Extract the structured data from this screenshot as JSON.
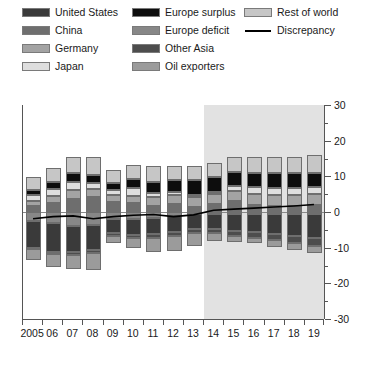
{
  "legend": {
    "columns": [
      [
        {
          "label": "United States",
          "key": "us",
          "color": "#3a3a3a",
          "type": "swatch",
          "icon": "legend-swatch"
        },
        {
          "label": "China",
          "key": "china",
          "color": "#6e6e6e",
          "type": "swatch",
          "icon": "legend-swatch"
        },
        {
          "label": "Germany",
          "key": "germany",
          "color": "#a3a3a3",
          "type": "swatch",
          "icon": "legend-swatch"
        },
        {
          "label": "Japan",
          "key": "japan",
          "color": "#dedede",
          "type": "swatch",
          "icon": "legend-swatch"
        }
      ],
      [
        {
          "label": "Europe surplus",
          "key": "europe_surplus",
          "color": "#0d0d0d",
          "type": "swatch",
          "icon": "legend-swatch"
        },
        {
          "label": "Europe deficit",
          "key": "europe_deficit",
          "color": "#878787",
          "type": "swatch",
          "icon": "legend-swatch"
        },
        {
          "label": "Other Asia",
          "key": "other_asia",
          "color": "#4d4d4d",
          "type": "swatch",
          "icon": "legend-swatch"
        },
        {
          "label": "Oil exporters",
          "key": "oil_exporters",
          "color": "#9b9b9b",
          "type": "swatch",
          "icon": "legend-swatch"
        }
      ],
      [
        {
          "label": "Rest of world",
          "key": "rest_of_world",
          "color": "#c6c6c6",
          "type": "swatch",
          "icon": "legend-swatch"
        },
        {
          "label": "Discrepancy",
          "key": "discrepancy",
          "color": "#000000",
          "type": "line",
          "icon": "legend-line"
        }
      ]
    ]
  },
  "chart_data": {
    "type": "bar",
    "stacked": true,
    "title": "",
    "subtitle": "",
    "xlabel": "",
    "ylabel": "",
    "ylim": [
      -30,
      30
    ],
    "yticks": [
      30,
      20,
      10,
      0,
      -10,
      -20,
      -30
    ],
    "yticks_minor": [
      25,
      15,
      5,
      -5,
      -15,
      -25
    ],
    "grid": false,
    "legend_position": "top",
    "axis_side": "right",
    "categories": [
      "2005",
      "06",
      "07",
      "08",
      "09",
      "10",
      "11",
      "12",
      "13",
      "14",
      "15",
      "16",
      "17",
      "18",
      "19"
    ],
    "forecast_start_category": "14",
    "forecast_shading": {
      "from": "13.5",
      "to": "19.5",
      "color": "#e2e2e2",
      "label": "projection"
    },
    "series": [
      {
        "name": "Rest of world",
        "key": "rest_of_world",
        "color": "#c6c6c6",
        "sign": "positive",
        "values": [
          3.5,
          4.0,
          4.5,
          5.0,
          3.5,
          4.0,
          4.5,
          4.0,
          4.0,
          4.0,
          4.0,
          4.5,
          4.5,
          4.5,
          5.0
        ]
      },
      {
        "name": "Europe surplus",
        "key": "europe_surplus",
        "color": "#0d0d0d",
        "sign": "positive",
        "values": [
          1.5,
          2.0,
          2.5,
          2.5,
          2.0,
          2.5,
          3.0,
          3.5,
          4.0,
          4.0,
          4.0,
          4.0,
          4.0,
          4.0,
          4.0
        ]
      },
      {
        "name": "Japan",
        "key": "japan",
        "color": "#dedede",
        "sign": "positive",
        "values": [
          1.8,
          2.0,
          2.1,
          1.5,
          1.5,
          2.2,
          1.3,
          0.7,
          0.8,
          0.6,
          1.4,
          2.0,
          2.0,
          2.0,
          2.0
        ]
      },
      {
        "name": "Germany",
        "key": "germany",
        "color": "#a3a3a3",
        "sign": "positive",
        "values": [
          1.4,
          1.9,
          2.5,
          2.3,
          2.0,
          2.1,
          2.3,
          2.5,
          2.6,
          2.9,
          2.9,
          3.0,
          3.0,
          3.0,
          3.0
        ]
      },
      {
        "name": "China",
        "key": "china",
        "color": "#6e6e6e",
        "sign": "positive",
        "values": [
          1.6,
          2.5,
          3.7,
          4.2,
          2.7,
          2.4,
          1.8,
          2.3,
          1.5,
          2.2,
          3.0,
          2.0,
          1.8,
          1.8,
          2.0
        ]
      },
      {
        "name": "Europe deficit",
        "key": "europe_deficit",
        "color": "#878787",
        "sign": "negative",
        "values": [
          -2.5,
          -3.2,
          -3.8,
          -3.6,
          -2.0,
          -2.0,
          -1.8,
          -1.2,
          -0.7,
          -0.6,
          -0.6,
          -0.6,
          -0.6,
          -0.7,
          -0.7
        ]
      },
      {
        "name": "United States",
        "key": "us",
        "color": "#3a3a3a",
        "sign": "negative",
        "values": [
          -7.5,
          -8.0,
          -7.5,
          -7.0,
          -4.0,
          -4.5,
          -4.5,
          -4.5,
          -4.0,
          -4.2,
          -4.8,
          -5.0,
          -5.5,
          -6.0,
          -6.5
        ]
      },
      {
        "name": "Other Asia",
        "key": "other_asia",
        "color": "#4d4d4d",
        "sign": "negative",
        "values": [
          -0.5,
          -0.6,
          -0.7,
          -0.8,
          -0.6,
          -0.8,
          -1.0,
          -1.1,
          -1.2,
          -1.2,
          -1.4,
          -1.6,
          -1.8,
          -2.0,
          -2.2
        ]
      },
      {
        "name": "Oil exporters",
        "key": "oil_exporters",
        "color": "#9b9b9b",
        "sign": "negative",
        "values": [
          -3.0,
          -3.5,
          -4.0,
          -5.0,
          -2.0,
          -2.8,
          -4.0,
          -4.0,
          -3.5,
          -2.0,
          -1.5,
          -1.5,
          -1.8,
          -2.0,
          -2.2
        ]
      }
    ],
    "line_series": [
      {
        "name": "Discrepancy",
        "key": "discrepancy",
        "color": "#000000",
        "values": [
          -2.0,
          -1.4,
          -1.2,
          -2.0,
          -1.4,
          -1.0,
          -0.8,
          -1.4,
          -0.9,
          0.4,
          0.7,
          1.0,
          1.3,
          1.6,
          2.0
        ]
      }
    ]
  }
}
